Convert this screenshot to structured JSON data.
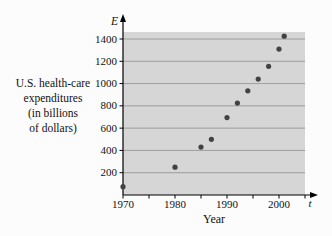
{
  "figure": {
    "left_label": "U.S. health-care\nexpenditures\n(in billions\nof dollars)",
    "y_axis_symbol": "E",
    "x_axis_symbol": "t",
    "x_title": "Year"
  },
  "chart_data": {
    "type": "scatter",
    "title": "",
    "xlabel": "Year",
    "ylabel": "U.S. health-care expenditures (in billions of dollars)",
    "x": [
      1970,
      1980,
      1985,
      1987,
      1990,
      1992,
      1994,
      1996,
      1998,
      2000,
      2001
    ],
    "y": [
      75,
      250,
      430,
      500,
      695,
      825,
      935,
      1040,
      1155,
      1310,
      1425
    ],
    "xlim": [
      1970,
      2005
    ],
    "ylim": [
      0,
      1450
    ],
    "x_ticks_labeled": [
      1970,
      1980,
      1990,
      2000
    ],
    "x_ticks_minor": [
      1975,
      1985,
      1995,
      2005
    ],
    "y_ticks": [
      200,
      400,
      600,
      800,
      1000,
      1200,
      1400
    ],
    "grid": "horizontal",
    "legend": "none",
    "colors": {
      "plot_bg": "#d6d6d6",
      "gridline": "#8f8f8f",
      "axis": "#000000",
      "point": "#424242",
      "text": "#111111"
    }
  }
}
